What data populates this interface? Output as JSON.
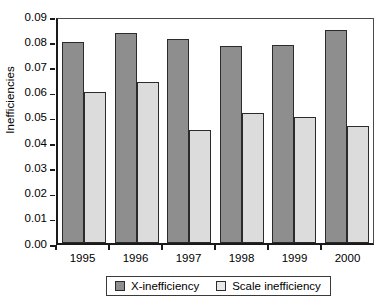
{
  "chart_data": {
    "type": "bar",
    "title": "",
    "xlabel": "",
    "ylabel": "Inefficiencies",
    "ylim": [
      0.0,
      0.09
    ],
    "ytick_step": 0.01,
    "grid": false,
    "legend_position": "bottom",
    "categories": [
      "1995",
      "1996",
      "1997",
      "1998",
      "1999",
      "2000"
    ],
    "ytick_labels": [
      "0.09",
      "0.08",
      "0.07",
      "0.06",
      "0.05",
      "0.04",
      "0.03",
      "0.02",
      "0.01",
      "0.00"
    ],
    "ytick_values": [
      0.09,
      0.08,
      0.07,
      0.06,
      0.05,
      0.04,
      0.03,
      0.02,
      0.01,
      0.0
    ],
    "series": [
      {
        "name": "X-inefficiency",
        "color": "#8e8e8e",
        "values": [
          0.0795,
          0.0833,
          0.081,
          0.0783,
          0.0785,
          0.0845
        ]
      },
      {
        "name": "Scale inefficiency",
        "color": "#dcdcdc",
        "values": [
          0.06,
          0.0638,
          0.045,
          0.0515,
          0.0498,
          0.0462
        ]
      }
    ]
  },
  "legend": {
    "items": [
      {
        "label": "X-inefficiency",
        "swatch": "x-ineff"
      },
      {
        "label": "Scale inefficiency",
        "swatch": "scale-ineff"
      }
    ]
  },
  "axes": {
    "y_label": "Inefficiencies"
  }
}
